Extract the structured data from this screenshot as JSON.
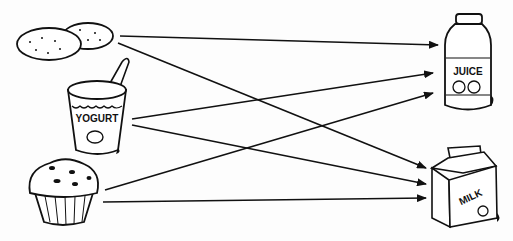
{
  "diagram": {
    "type": "matching-arrows",
    "sources": [
      {
        "id": "cookies",
        "label": "Cookies"
      },
      {
        "id": "yogurt",
        "label": "YOGURT"
      },
      {
        "id": "muffin",
        "label": "Muffin"
      }
    ],
    "targets": [
      {
        "id": "juice",
        "label": "JUICE"
      },
      {
        "id": "milk",
        "label": "MILK"
      }
    ],
    "edges": [
      {
        "from": "cookies",
        "to": "juice"
      },
      {
        "from": "cookies",
        "to": "milk"
      },
      {
        "from": "yogurt",
        "to": "juice"
      },
      {
        "from": "yogurt",
        "to": "milk"
      },
      {
        "from": "muffin",
        "to": "juice"
      },
      {
        "from": "muffin",
        "to": "milk"
      }
    ],
    "colors": {
      "ink": "#111111",
      "background": "#fdfdfd"
    }
  }
}
